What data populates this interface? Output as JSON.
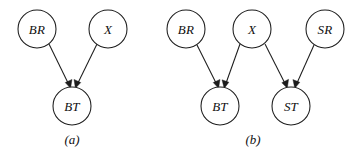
{
  "figure": {
    "background_color": "#ffffff",
    "stroke_color": "#1c1c1c",
    "node_fill": "#ffffff",
    "width": 361,
    "height": 158
  },
  "panels": [
    {
      "id": "panel-a",
      "caption": "(a)",
      "caption_x": 72,
      "caption_y": 139,
      "nodes": [
        {
          "id": "a-BR",
          "label": "BR",
          "cx": 37,
          "cy": 29,
          "r": 19
        },
        {
          "id": "a-X",
          "label": "X",
          "cx": 108,
          "cy": 29,
          "r": 19
        },
        {
          "id": "a-BT",
          "label": "BT",
          "cx": 72,
          "cy": 106,
          "r": 19
        }
      ],
      "edges": [
        {
          "id": "a-edge-BR-BT",
          "from": "BR",
          "to": "BT",
          "x1": 49,
          "y1": 44,
          "x2": 68,
          "y2": 84
        },
        {
          "id": "a-edge-X-BT",
          "from": "X",
          "to": "BT",
          "x1": 97,
          "y1": 44,
          "x2": 78,
          "y2": 84
        }
      ]
    },
    {
      "id": "panel-b",
      "caption": "(b)",
      "caption_x": 253,
      "caption_y": 139,
      "nodes": [
        {
          "id": "b-BR",
          "label": "BR",
          "cx": 186,
          "cy": 29,
          "r": 19
        },
        {
          "id": "b-X",
          "label": "X",
          "cx": 252,
          "cy": 29,
          "r": 19
        },
        {
          "id": "b-SR",
          "label": "SR",
          "cx": 325,
          "cy": 29,
          "r": 19
        },
        {
          "id": "b-BT",
          "label": "BT",
          "cx": 220,
          "cy": 106,
          "r": 19
        },
        {
          "id": "b-ST",
          "label": "ST",
          "cx": 291,
          "cy": 106,
          "r": 19
        }
      ],
      "edges": [
        {
          "id": "b-edge-BR-BT",
          "from": "BR",
          "to": "BT",
          "x1": 197,
          "y1": 45,
          "x2": 216,
          "y2": 84
        },
        {
          "id": "b-edge-X-BT",
          "from": "X",
          "to": "BT",
          "x1": 240,
          "y1": 44,
          "x2": 226,
          "y2": 84
        },
        {
          "id": "b-edge-X-ST",
          "from": "X",
          "to": "ST",
          "x1": 265,
          "y1": 44,
          "x2": 286,
          "y2": 84
        },
        {
          "id": "b-edge-SR-ST",
          "from": "SR",
          "to": "ST",
          "x1": 314,
          "y1": 45,
          "x2": 297,
          "y2": 84
        }
      ]
    }
  ]
}
